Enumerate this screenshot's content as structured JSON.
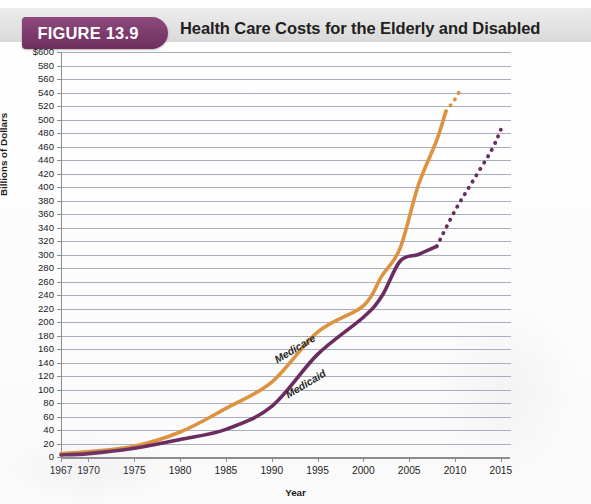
{
  "figure": {
    "badge": "FIGURE 13.9",
    "title": "Health Care Costs for the Elderly and Disabled"
  },
  "colors": {
    "medicare": "#dd9240",
    "medicaid": "#6b2c5f",
    "badge": "#7c3a6c",
    "grid": "#9aa0b4",
    "axis": "#8c8c93"
  },
  "chart_data": {
    "type": "line",
    "title": "Health Care Costs for the Elderly and Disabled",
    "xlabel": "Year",
    "ylabel": "Billions of Dollars",
    "xlim": [
      1967,
      2016
    ],
    "ylim": [
      0,
      600
    ],
    "grid": true,
    "legend": "inline-labels",
    "ytick_labels": [
      "$600",
      "580",
      "560",
      "540",
      "520",
      "500",
      "480",
      "460",
      "440",
      "420",
      "400",
      "380",
      "360",
      "340",
      "320",
      "300",
      "280",
      "260",
      "240",
      "220",
      "200",
      "180",
      "160",
      "140",
      "120",
      "100",
      "80",
      "60",
      "40",
      "20",
      "0"
    ],
    "ytick_values": [
      600,
      580,
      560,
      540,
      520,
      500,
      480,
      460,
      440,
      420,
      400,
      380,
      360,
      340,
      320,
      300,
      280,
      260,
      240,
      220,
      200,
      180,
      160,
      140,
      120,
      100,
      80,
      60,
      40,
      20,
      0
    ],
    "xtick_labels": [
      "1967",
      "1970",
      "1975",
      "1980",
      "1985",
      "1990",
      "1995",
      "2000",
      "2005",
      "2010",
      "2015"
    ],
    "xtick_values": [
      1967,
      1970,
      1975,
      1980,
      1985,
      1990,
      1995,
      2000,
      2005,
      2010,
      2015
    ],
    "series": [
      {
        "name": "Medicare",
        "color": "#dd9240",
        "style": "solid-then-dotted",
        "label_position": {
          "x": 272,
          "y": 355,
          "rotate": -31
        },
        "x": [
          1967,
          1970,
          1975,
          1980,
          1985,
          1990,
          1995,
          2000,
          2002,
          2004,
          2006,
          2008,
          2009
        ],
        "values": [
          5,
          8,
          16,
          37,
          72,
          111,
          185,
          224,
          268,
          309,
          403,
          469,
          512
        ],
        "projected_x": [
          2009,
          2010,
          2010.6
        ],
        "projected_values": [
          512,
          530,
          545
        ]
      },
      {
        "name": "Medicaid",
        "color": "#6b2c5f",
        "style": "solid-then-dotted",
        "label_position": {
          "x": 283,
          "y": 390,
          "rotate": -31
        },
        "x": [
          1967,
          1970,
          1975,
          1980,
          1985,
          1990,
          1995,
          2000,
          2002,
          2004,
          2006,
          2008
        ],
        "values": [
          3,
          5,
          13,
          26,
          41,
          75,
          152,
          207,
          238,
          290,
          300,
          312
        ],
        "projected_x": [
          2008,
          2010,
          2012,
          2014,
          2015
        ],
        "projected_values": [
          312,
          365,
          410,
          455,
          485
        ]
      }
    ]
  }
}
